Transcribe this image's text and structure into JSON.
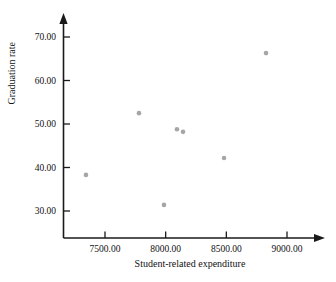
{
  "chart_data": {
    "type": "scatter",
    "title": "",
    "xlabel": "Student-related expenditure",
    "ylabel": "Graduation rate",
    "xlim": [
      7200,
      9100
    ],
    "ylim": [
      26,
      72
    ],
    "grid": false,
    "legend": "none",
    "marker": {
      "shape": "circle",
      "color": "#a6a6a6",
      "size": 4.6
    },
    "xticks": [
      7500,
      8000,
      8500,
      9000
    ],
    "xtick_labels": [
      "7500.00",
      "8000.00",
      "8500.00",
      "9000.00"
    ],
    "yticks": [
      30,
      40,
      50,
      60,
      70
    ],
    "ytick_labels": [
      "30.00",
      "40.00",
      "50.00",
      "60.00",
      "70.00"
    ],
    "points": [
      {
        "x": 7343,
        "y": 38.3
      },
      {
        "x": 7780,
        "y": 52.5
      },
      {
        "x": 7986,
        "y": 31.4
      },
      {
        "x": 8093,
        "y": 48.8
      },
      {
        "x": 8143,
        "y": 48.2
      },
      {
        "x": 8481,
        "y": 42.2
      },
      {
        "x": 8827,
        "y": 66.3
      }
    ]
  },
  "axes": {
    "x_axis_name": "x-axis",
    "y_axis_name": "y-axis"
  },
  "colors": {
    "axis": "#1a1a1a",
    "marker": "#a6a6a6",
    "text": "#111111",
    "background": "#ffffff"
  }
}
